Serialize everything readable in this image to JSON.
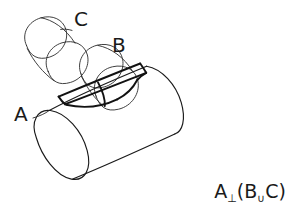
{
  "diagram": {
    "style": "hand-drawn technical sketch, black ink on white",
    "background_color": "#ffffff",
    "stroke_color": "#1a1a1a",
    "labels": {
      "a": "A",
      "b": "B",
      "c": "C"
    },
    "formula": {
      "datum": "A",
      "relation_symbol": "⊥",
      "open_paren": "(",
      "first_feature": "B",
      "union_symbol": "∪",
      "second_feature": "C",
      "close_paren": ")",
      "full_text": "A⊥(B∪C)"
    },
    "shapes": [
      {
        "name": "cylinder-a",
        "role": "datum-feature",
        "description": "large cylinder running from lower-left to upper-right, near end cap visible as full ellipse",
        "emphasis": "normal"
      },
      {
        "name": "cylinder-b",
        "role": "toleranced-feature",
        "description": "small cylinder rising up-left from top of cylinder A, nearer of the two",
        "emphasis": "light"
      },
      {
        "name": "cylinder-c",
        "role": "toleranced-feature",
        "description": "small cylinder rising up-left beyond cylinder B, farther of the two",
        "emphasis": "light"
      },
      {
        "name": "intersection-patch",
        "role": "projected-tolerance-zone",
        "description": "bold parallelogram drawn on the upper surface of cylinder A where B and C meet it",
        "emphasis": "bold"
      }
    ]
  }
}
